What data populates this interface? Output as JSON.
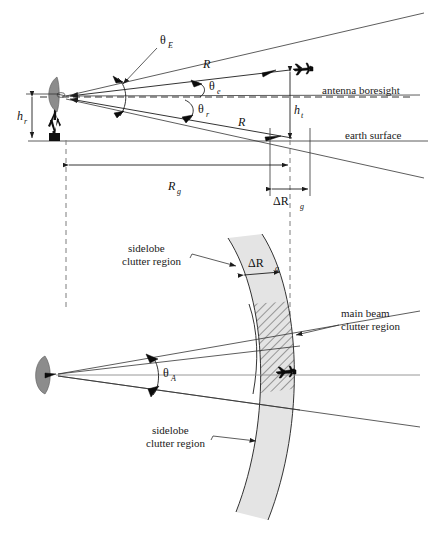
{
  "figure": {
    "colors": {
      "line": "#1d1d1d",
      "dish_gray": "#8c8c8c",
      "tower_black": "#101010",
      "shade_gray": "#e4e4e4",
      "dash_gray": "#7d7d7d"
    }
  },
  "upper": {
    "angle_elevation_beam": "θ",
    "angle_elevation_beam_sub": "E",
    "angle_target_elev": "θ",
    "angle_target_elev_sub": "e",
    "angle_grazing": "θ",
    "angle_grazing_sub": "r",
    "range_upper": "R",
    "range_lower": "R",
    "radar_height": "h",
    "radar_height_sub": "r",
    "target_height": "h",
    "target_height_sub": "t",
    "ground_range": "R",
    "ground_range_sub": "g",
    "range_resolution": "ΔR",
    "range_resolution_sub": "g",
    "boresight_label": "antenna boresight",
    "earth_label": "earth surface"
  },
  "lower": {
    "azimuth_angle": "θ",
    "azimuth_angle_sub": "A",
    "range_resolution": "ΔR",
    "range_resolution_sub": "g",
    "sidelobe_top_line1": "sidelobe",
    "sidelobe_top_line2": "clutter region",
    "sidelobe_bottom_line1": "sidelobe",
    "sidelobe_bottom_line2": "clutter region",
    "mainbeam_line1": "main beam",
    "mainbeam_line2": "clutter region"
  },
  "icons": {
    "antenna_dish": "parabolic-dish-icon",
    "antenna_tower": "antenna-tower-icon",
    "target_aircraft": "aircraft-icon"
  }
}
